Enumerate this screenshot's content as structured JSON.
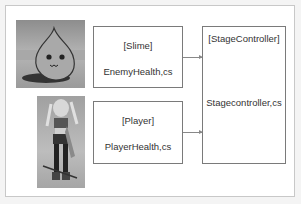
{
  "diagram": {
    "slime": {
      "title": "[Slime]",
      "file": "EnemyHealth,cs",
      "image": "slime-character-image"
    },
    "player": {
      "title": "[Player]",
      "file": "PlayerHealth,cs",
      "image": "player-character-image"
    },
    "controller": {
      "title": "[StageController]",
      "file": "Stagecontroller,cs"
    },
    "arrows": [
      {
        "from": "slime",
        "to": "controller"
      },
      {
        "from": "player",
        "to": "controller"
      }
    ],
    "colors": {
      "border": "#7a7a7a",
      "arrow": "#888888",
      "text": "#333333"
    }
  }
}
